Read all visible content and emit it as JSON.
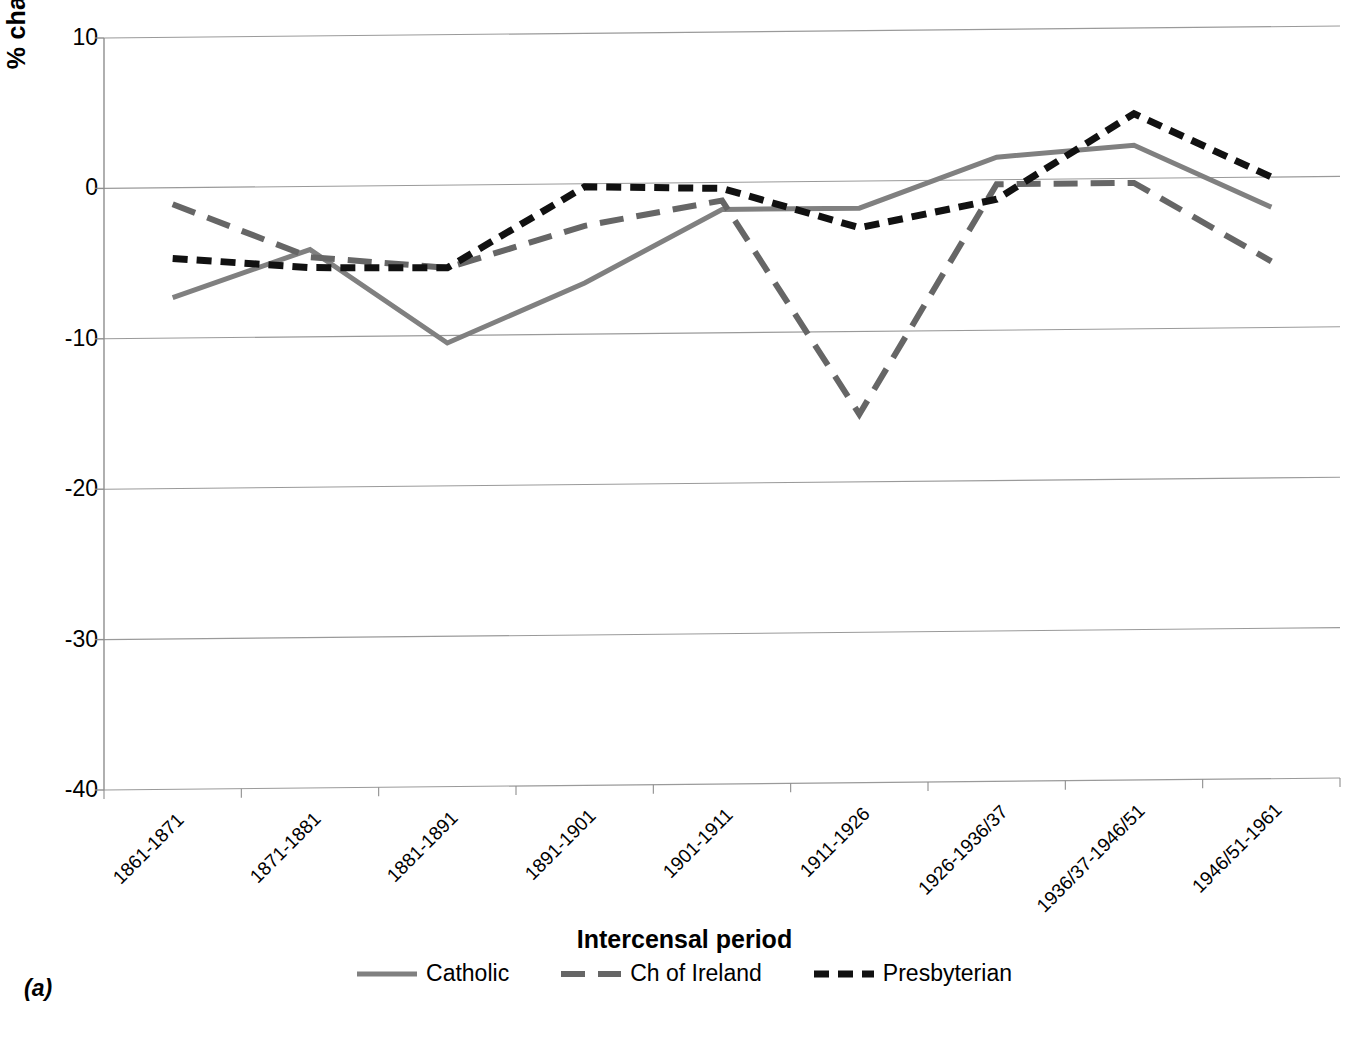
{
  "panel_label": "(a)",
  "axes": {
    "ylabel": "% change",
    "xlabel": "Intercensal period",
    "yticks": [
      "10",
      "0",
      "-10",
      "-20",
      "-30",
      "-40"
    ]
  },
  "legend": {
    "items": [
      {
        "label": "Catholic",
        "style": "solid",
        "color": "#808080"
      },
      {
        "label": "Ch of Ireland",
        "style": "long-dash",
        "color": "#666666"
      },
      {
        "label": "Presbyterian",
        "style": "short-dash",
        "color": "#111111"
      }
    ]
  },
  "chart_data": {
    "type": "line",
    "title": "",
    "xlabel": "Intercensal period",
    "ylabel": "% change",
    "ylim": [
      -40,
      10
    ],
    "ytick_values": [
      10,
      0,
      -10,
      -20,
      -30,
      -40
    ],
    "grid": true,
    "legend_position": "bottom",
    "categories": [
      "1861-1871",
      "1871-1881",
      "1881-1891",
      "1891-1901",
      "1901-1911",
      "1911-1926",
      "1926-1936/37",
      "1936/37-1946/51",
      "1946/51-1961"
    ],
    "series": [
      {
        "name": "Catholic",
        "color": "#808080",
        "dash": "solid",
        "values": [
          -7.3,
          -4.2,
          -10.5,
          -6.6,
          -1.8,
          -1.8,
          1.5,
          2.2,
          -2.0
        ]
      },
      {
        "name": "Ch of Ireland",
        "color": "#666666",
        "dash": "long-dash",
        "values": [
          -1.1,
          -4.7,
          -5.5,
          -2.8,
          -1.2,
          -15.5,
          -0.3,
          -0.3,
          -5.6
        ]
      },
      {
        "name": "Presbyterian",
        "color": "#111111",
        "dash": "short-dash",
        "values": [
          -4.7,
          -5.4,
          -5.5,
          -0.2,
          -0.4,
          -3.1,
          -1.3,
          4.3,
          0.0
        ]
      }
    ]
  }
}
